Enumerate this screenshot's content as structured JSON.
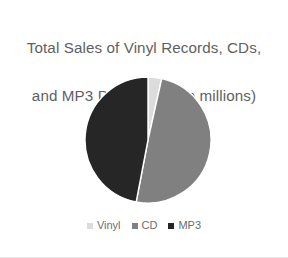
{
  "chart_data": {
    "type": "pie",
    "title": "Total Sales of Vinyl Records, CDs,\nand MP3 Downloads (in millions)",
    "title_line1": "Total Sales of Vinyl Records, CDs,",
    "title_line2": "and MP3 Downloads (in millions)",
    "categories": [
      "Vinyl",
      "CD",
      "MP3"
    ],
    "values": [
      3.5,
      49.5,
      47
    ],
    "units": "millions",
    "legend_position": "bottom",
    "grid": false,
    "xlabel": "",
    "ylabel": "",
    "slices": [
      {
        "label": "Vinyl",
        "value": 3.5,
        "percent": 3.5,
        "color": "#dcdcdc",
        "start_angle": 0,
        "end_angle": 12.6
      },
      {
        "label": "CD",
        "value": 49.5,
        "percent": 49.5,
        "color": "#808080",
        "start_angle": 12.6,
        "end_angle": 190.8
      },
      {
        "label": "MP3",
        "value": 47,
        "percent": 47,
        "color": "#262626",
        "start_angle": 190.8,
        "end_angle": 360
      }
    ]
  },
  "legend": {
    "items": [
      {
        "label": "Vinyl",
        "color": "#dcdcdc",
        "marker": "square-marker"
      },
      {
        "label": "CD",
        "color": "#808080",
        "marker": "square-marker"
      },
      {
        "label": "MP3",
        "color": "#262626",
        "marker": "square-marker"
      }
    ]
  },
  "colors": {
    "vinyl": "#dcdcdc",
    "cd": "#808080",
    "mp3": "#262626",
    "title_text": "#5f5f5f",
    "legend_text": "#6d6d6d",
    "background": "#ffffff",
    "slice_border": "#ffffff"
  },
  "geometry": {
    "center_x": 64,
    "center_y": 64,
    "radius": 63
  }
}
